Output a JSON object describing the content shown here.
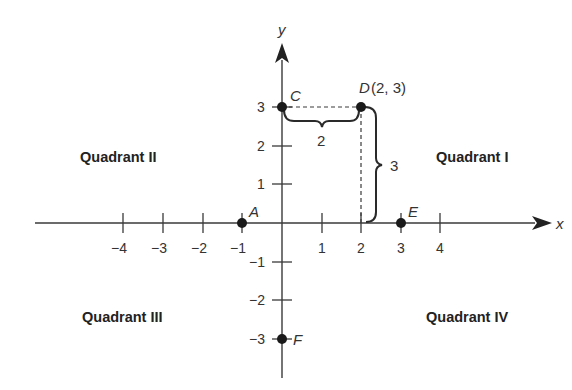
{
  "diagram": {
    "type": "coordinate-plane",
    "axes": {
      "x_label": "x",
      "y_label": "y",
      "x_ticks": [
        {
          "value": -4,
          "label": "−4"
        },
        {
          "value": -3,
          "label": "−3"
        },
        {
          "value": -2,
          "label": "−2"
        },
        {
          "value": -1,
          "label": "−1"
        },
        {
          "value": 1,
          "label": "1"
        },
        {
          "value": 2,
          "label": "2"
        },
        {
          "value": 3,
          "label": "3"
        },
        {
          "value": 4,
          "label": "4"
        }
      ],
      "y_ticks": [
        {
          "value": 3,
          "label": "3"
        },
        {
          "value": 2,
          "label": "2"
        },
        {
          "value": 1,
          "label": "1"
        },
        {
          "value": -1,
          "label": "−1"
        },
        {
          "value": -2,
          "label": "−2"
        },
        {
          "value": -3,
          "label": "−3"
        }
      ]
    },
    "points": [
      {
        "name": "A",
        "x": -1,
        "y": 0,
        "label": "A"
      },
      {
        "name": "C",
        "x": 0,
        "y": 3,
        "label": "C"
      },
      {
        "name": "D",
        "x": 2,
        "y": 3,
        "label": "D",
        "coord_label": "(2, 3)"
      },
      {
        "name": "E",
        "x": 3,
        "y": 0,
        "label": "E"
      },
      {
        "name": "F",
        "x": 0,
        "y": -3,
        "label": "F"
      }
    ],
    "dimensions": {
      "horizontal": "2",
      "vertical": "3"
    },
    "quadrants": {
      "I": "Quadrant I",
      "II": "Quadrant II",
      "III": "Quadrant III",
      "IV": "Quadrant IV"
    },
    "colors": {
      "line": "#3a3a3a",
      "point": "#1a1a1a",
      "text": "#333333"
    }
  }
}
